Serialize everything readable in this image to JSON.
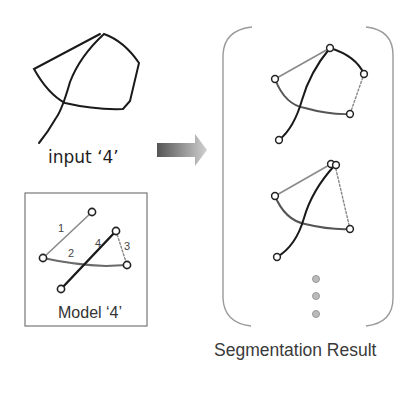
{
  "input": {
    "label": "input ‘4’"
  },
  "arrow": {
    "icon": "right-arrow-icon",
    "color_start": "#555555",
    "color_end": "#cfcfcf"
  },
  "model": {
    "label": "Model ‘4’",
    "segments": [
      {
        "id": "1",
        "style": "gray-solid"
      },
      {
        "id": "2",
        "style": "gray-solid"
      },
      {
        "id": "3",
        "style": "dotted"
      },
      {
        "id": "4",
        "style": "black-solid"
      }
    ]
  },
  "results": {
    "label": "Segmentation Result",
    "ellipsis_dots": 3
  },
  "colors": {
    "stroke_dark": "#1a1a1a",
    "stroke_gray": "#8a8a8a",
    "bracket": "#9a9a9a",
    "dot": "#b5b5b5"
  }
}
